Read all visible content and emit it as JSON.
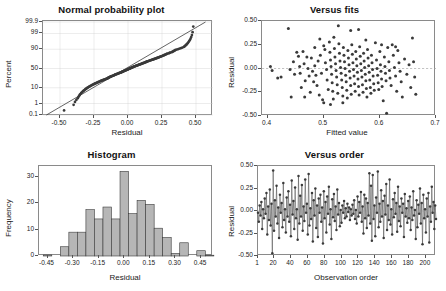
{
  "figure": {
    "panels": [
      "Normal probability plot",
      "Versus fits",
      "Histogram",
      "Versus order"
    ]
  },
  "chart_data": [
    {
      "type": "scatter",
      "title": "Normal probability plot",
      "xlabel": "Residual",
      "ylabel": "Percent",
      "xlim": [
        -0.625,
        0.625
      ],
      "xticks": [
        -0.5,
        -0.25,
        0.0,
        0.25,
        0.5
      ],
      "xticklabels": [
        "-0.50",
        "-0.25",
        "0.00",
        "0.25",
        "0.50"
      ],
      "yscale": "normal-probability",
      "yticks": [
        0.1,
        1,
        10,
        50,
        90,
        99,
        99.9
      ],
      "yticklabels": [
        "0.1",
        "1",
        "10",
        "50",
        "90",
        "99",
        "99.9"
      ],
      "grid": true,
      "reference_line": {
        "type": "fit-line",
        "x": [
          -0.6,
          0.57
        ],
        "y": [
          0.1,
          99.9
        ]
      },
      "x": [
        -0.47,
        -0.4,
        -0.39,
        -0.38,
        -0.37,
        -0.365,
        -0.36,
        -0.355,
        -0.35,
        -0.345,
        -0.34,
        -0.335,
        -0.33,
        -0.325,
        -0.32,
        -0.315,
        -0.31,
        -0.305,
        -0.3,
        -0.295,
        -0.29,
        -0.285,
        -0.28,
        -0.275,
        -0.27,
        -0.265,
        -0.26,
        -0.255,
        -0.25,
        -0.245,
        -0.24,
        -0.235,
        -0.23,
        -0.225,
        -0.22,
        -0.215,
        -0.21,
        -0.205,
        -0.2,
        -0.195,
        -0.19,
        -0.185,
        -0.18,
        -0.175,
        -0.17,
        -0.165,
        -0.16,
        -0.155,
        -0.15,
        -0.148,
        -0.145,
        -0.142,
        -0.14,
        -0.136,
        -0.132,
        -0.128,
        -0.124,
        -0.12,
        -0.116,
        -0.112,
        -0.108,
        -0.104,
        -0.1,
        -0.097,
        -0.094,
        -0.09,
        -0.086,
        -0.082,
        -0.078,
        -0.074,
        -0.07,
        -0.066,
        -0.062,
        -0.058,
        -0.054,
        -0.05,
        -0.047,
        -0.044,
        -0.04,
        -0.037,
        -0.034,
        -0.03,
        -0.027,
        -0.024,
        -0.02,
        -0.017,
        -0.014,
        -0.01,
        -0.007,
        -0.004,
        0.0,
        0.003,
        0.006,
        0.01,
        0.013,
        0.016,
        0.02,
        0.023,
        0.026,
        0.03,
        0.033,
        0.036,
        0.04,
        0.043,
        0.046,
        0.05,
        0.054,
        0.058,
        0.062,
        0.066,
        0.07,
        0.074,
        0.078,
        0.082,
        0.086,
        0.09,
        0.094,
        0.098,
        0.102,
        0.106,
        0.11,
        0.114,
        0.118,
        0.122,
        0.126,
        0.13,
        0.134,
        0.138,
        0.142,
        0.146,
        0.15,
        0.155,
        0.16,
        0.165,
        0.17,
        0.175,
        0.18,
        0.185,
        0.19,
        0.195,
        0.2,
        0.205,
        0.21,
        0.215,
        0.22,
        0.225,
        0.23,
        0.235,
        0.24,
        0.245,
        0.25,
        0.255,
        0.26,
        0.265,
        0.27,
        0.275,
        0.28,
        0.285,
        0.29,
        0.3,
        0.305,
        0.31,
        0.32,
        0.325,
        0.33,
        0.335,
        0.34,
        0.345,
        0.35,
        0.36,
        0.37,
        0.38,
        0.39,
        0.4,
        0.41,
        0.415,
        0.42,
        0.425,
        0.43,
        0.435,
        0.44,
        0.445,
        0.45,
        0.455,
        0.46,
        0.465,
        0.47,
        0.475,
        0.48
      ],
      "n": 189
    },
    {
      "type": "scatter",
      "title": "Versus fits",
      "xlabel": "Fitted value",
      "ylabel": "Residual",
      "xlim": [
        0.39,
        0.7
      ],
      "xticks": [
        0.4,
        0.5,
        0.6,
        0.7
      ],
      "xticklabels": [
        "0.4",
        "0.5",
        "0.6",
        "0.7"
      ],
      "ylim": [
        -0.5,
        0.5
      ],
      "yticks": [
        -0.5,
        -0.25,
        0.0,
        0.25,
        0.5
      ],
      "yticklabels": [
        "-0.50",
        "-0.25",
        "0.00",
        "0.25",
        "0.50"
      ],
      "grid": false,
      "reference_line": {
        "type": "hline",
        "y": 0.0
      },
      "points": [
        [
          0.405,
          0.02
        ],
        [
          0.408,
          -0.02
        ],
        [
          0.418,
          -0.1
        ],
        [
          0.424,
          -0.09
        ],
        [
          0.437,
          0.42
        ],
        [
          0.44,
          -0.01
        ],
        [
          0.442,
          -0.3
        ],
        [
          0.448,
          -0.06
        ],
        [
          0.452,
          0.17
        ],
        [
          0.455,
          0.13
        ],
        [
          0.457,
          0.02
        ],
        [
          0.458,
          -0.05
        ],
        [
          0.46,
          -0.2
        ],
        [
          0.463,
          0.18
        ],
        [
          0.465,
          0.05
        ],
        [
          0.467,
          -0.13
        ],
        [
          0.47,
          0.12
        ],
        [
          0.472,
          0.0
        ],
        [
          0.474,
          -0.08
        ],
        [
          0.476,
          -0.25
        ],
        [
          0.478,
          0.11
        ],
        [
          0.48,
          -0.03
        ],
        [
          0.482,
          -0.14
        ],
        [
          0.484,
          0.03
        ],
        [
          0.486,
          -0.07
        ],
        [
          0.488,
          -0.18
        ],
        [
          0.49,
          0.08
        ],
        [
          0.492,
          -0.28
        ],
        [
          0.494,
          0.14
        ],
        [
          0.496,
          -0.05
        ],
        [
          0.498,
          -0.33
        ],
        [
          0.5,
          0.24
        ],
        [
          0.502,
          0.2
        ],
        [
          0.503,
          0.06
        ],
        [
          0.505,
          -0.01
        ],
        [
          0.506,
          -0.12
        ],
        [
          0.508,
          -0.22
        ],
        [
          0.51,
          0.28
        ],
        [
          0.511,
          0.17
        ],
        [
          0.512,
          0.09
        ],
        [
          0.513,
          0.02
        ],
        [
          0.514,
          -0.06
        ],
        [
          0.515,
          -0.15
        ],
        [
          0.516,
          -0.24
        ],
        [
          0.517,
          -0.32
        ],
        [
          0.518,
          0.33
        ],
        [
          0.519,
          0.21
        ],
        [
          0.52,
          0.12
        ],
        [
          0.521,
          0.05
        ],
        [
          0.522,
          -0.02
        ],
        [
          0.523,
          -0.09
        ],
        [
          0.524,
          -0.17
        ],
        [
          0.525,
          -0.26
        ],
        [
          0.526,
          0.45
        ],
        [
          0.527,
          0.26
        ],
        [
          0.528,
          0.16
        ],
        [
          0.529,
          0.08
        ],
        [
          0.53,
          0.01
        ],
        [
          0.531,
          -0.05
        ],
        [
          0.532,
          -0.12
        ],
        [
          0.533,
          -0.2
        ],
        [
          0.534,
          -0.29
        ],
        [
          0.535,
          0.22
        ],
        [
          0.536,
          0.14
        ],
        [
          0.537,
          0.07
        ],
        [
          0.538,
          0.0
        ],
        [
          0.539,
          -0.07
        ],
        [
          0.54,
          -0.14
        ],
        [
          0.541,
          -0.23
        ],
        [
          0.542,
          -0.31
        ],
        [
          0.543,
          0.19
        ],
        [
          0.544,
          0.11
        ],
        [
          0.545,
          0.04
        ],
        [
          0.546,
          -0.03
        ],
        [
          0.547,
          -0.1
        ],
        [
          0.548,
          -0.18
        ],
        [
          0.549,
          -0.27
        ],
        [
          0.55,
          0.25
        ],
        [
          0.551,
          0.15
        ],
        [
          0.552,
          0.06
        ],
        [
          0.553,
          -0.01
        ],
        [
          0.554,
          -0.08
        ],
        [
          0.555,
          -0.16
        ],
        [
          0.556,
          -0.24
        ],
        [
          0.557,
          0.18
        ],
        [
          0.558,
          0.1
        ],
        [
          0.559,
          0.03
        ],
        [
          0.56,
          -0.04
        ],
        [
          0.561,
          -0.11
        ],
        [
          0.562,
          -0.19
        ],
        [
          0.563,
          -0.28
        ],
        [
          0.564,
          0.23
        ],
        [
          0.565,
          0.13
        ],
        [
          0.566,
          0.05
        ],
        [
          0.567,
          -0.02
        ],
        [
          0.568,
          -0.09
        ],
        [
          0.569,
          -0.17
        ],
        [
          0.57,
          -0.25
        ],
        [
          0.571,
          0.16
        ],
        [
          0.572,
          0.08
        ],
        [
          0.573,
          0.01
        ],
        [
          0.574,
          -0.06
        ],
        [
          0.575,
          -0.13
        ],
        [
          0.576,
          -0.21
        ],
        [
          0.577,
          -0.3
        ],
        [
          0.578,
          0.2
        ],
        [
          0.579,
          0.11
        ],
        [
          0.58,
          0.03
        ],
        [
          0.581,
          -0.04
        ],
        [
          0.582,
          -0.12
        ],
        [
          0.583,
          -0.2
        ],
        [
          0.584,
          -0.26
        ],
        [
          0.585,
          0.14
        ],
        [
          0.586,
          0.06
        ],
        [
          0.587,
          -0.01
        ],
        [
          0.588,
          -0.08
        ],
        [
          0.589,
          -0.16
        ],
        [
          0.59,
          -0.23
        ],
        [
          0.592,
          0.27
        ],
        [
          0.594,
          0.09
        ],
        [
          0.595,
          0.0
        ],
        [
          0.596,
          -0.07
        ],
        [
          0.597,
          -0.15
        ],
        [
          0.598,
          -0.22
        ],
        [
          0.6,
          0.18
        ],
        [
          0.601,
          0.04
        ],
        [
          0.602,
          -0.03
        ],
        [
          0.603,
          -0.11
        ],
        [
          0.604,
          -0.19
        ],
        [
          0.606,
          -0.34
        ],
        [
          0.608,
          0.12
        ],
        [
          0.609,
          0.02
        ],
        [
          0.61,
          -0.05
        ],
        [
          0.611,
          -0.13
        ],
        [
          0.612,
          -0.47
        ],
        [
          0.614,
          0.22
        ],
        [
          0.616,
          0.07
        ],
        [
          0.617,
          -0.02
        ],
        [
          0.618,
          -0.1
        ],
        [
          0.62,
          -0.18
        ],
        [
          0.622,
          0.25
        ],
        [
          0.624,
          0.14
        ],
        [
          0.626,
          0.01
        ],
        [
          0.628,
          -0.08
        ],
        [
          0.63,
          -0.24
        ],
        [
          0.632,
          0.19
        ],
        [
          0.634,
          0.06
        ],
        [
          0.636,
          -0.03
        ],
        [
          0.638,
          -0.14
        ],
        [
          0.64,
          -0.3
        ],
        [
          0.644,
          0.1
        ],
        [
          0.648,
          -0.06
        ],
        [
          0.652,
          0.04
        ],
        [
          0.655,
          -0.2
        ],
        [
          0.658,
          0.32
        ],
        [
          0.66,
          0.07
        ],
        [
          0.662,
          -0.09
        ],
        [
          0.664,
          -0.27
        ],
        [
          0.5,
          -0.36
        ],
        [
          0.512,
          -0.38
        ],
        [
          0.534,
          -0.36
        ],
        [
          0.548,
          0.4
        ],
        [
          0.562,
          0.41
        ],
        [
          0.484,
          0.22
        ],
        [
          0.466,
          -0.3
        ],
        [
          0.446,
          0.07
        ],
        [
          0.493,
          0.31
        ],
        [
          0.575,
          0.3
        ],
        [
          0.603,
          0.25
        ],
        [
          0.628,
          0.23
        ]
      ]
    },
    {
      "type": "bar",
      "title": "Histogram",
      "xlabel": "Residual",
      "ylabel": "Frequency",
      "xlim": [
        -0.5,
        0.52
      ],
      "xticks": [
        -0.45,
        -0.3,
        -0.15,
        0.0,
        0.15,
        0.3,
        0.45
      ],
      "xticklabels": [
        "-0.45",
        "-0.30",
        "-0.15",
        "0.00",
        "0.15",
        "0.30",
        "0.45"
      ],
      "ylim": [
        0,
        34
      ],
      "yticks": [
        0,
        10,
        20,
        30
      ],
      "yticklabels": [
        "0",
        "10",
        "20",
        "30"
      ],
      "bin_width": 0.05,
      "bin_starts": [
        -0.475,
        -0.425,
        -0.375,
        -0.325,
        -0.275,
        -0.225,
        -0.175,
        -0.125,
        -0.075,
        -0.025,
        0.025,
        0.075,
        0.125,
        0.175,
        0.225,
        0.275,
        0.325,
        0.375,
        0.425,
        0.475
      ],
      "values": [
        0.4,
        0,
        3.5,
        9,
        9,
        17.5,
        14,
        18.5,
        14,
        32,
        16,
        21,
        19.5,
        10.5,
        7,
        1,
        5,
        0,
        2,
        0.3
      ]
    },
    {
      "type": "line",
      "title": "Versus order",
      "xlabel": "Observation order",
      "ylabel": "Residual",
      "xlim": [
        1,
        212
      ],
      "xticks": [
        1,
        20,
        40,
        60,
        80,
        100,
        120,
        140,
        160,
        180,
        200
      ],
      "xticklabels": [
        "1",
        "20",
        "40",
        "60",
        "80",
        "100",
        "120",
        "140",
        "160",
        "180",
        "200"
      ],
      "ylim": [
        -0.5,
        0.5
      ],
      "yticks": [
        -0.5,
        -0.25,
        0.0,
        0.25,
        0.5
      ],
      "yticklabels": [
        "-0.50",
        "-0.25",
        "0.00",
        "0.25",
        "0.50"
      ],
      "reference_line": {
        "type": "hline",
        "y": 0.0
      },
      "markers": true,
      "values": [
        -0.02,
        -0.12,
        0.06,
        -0.05,
        0.1,
        -0.2,
        0.02,
        -0.08,
        0.14,
        -0.03,
        0.2,
        -0.26,
        0.05,
        -0.1,
        0.24,
        -0.16,
        0.08,
        -0.47,
        0.45,
        -0.22,
        0.12,
        -0.06,
        0.28,
        -0.14,
        0.04,
        -0.3,
        0.18,
        -0.02,
        0.09,
        -0.18,
        0.31,
        -0.1,
        0.02,
        -0.24,
        0.15,
        -0.06,
        0.22,
        -0.12,
        0.07,
        -0.28,
        0.34,
        -0.04,
        0.11,
        -0.2,
        0.26,
        -0.08,
        0.02,
        -0.32,
        0.39,
        -0.14,
        0.17,
        -0.06,
        0.29,
        -0.22,
        0.05,
        -0.11,
        0.35,
        -0.02,
        0.08,
        -0.26,
        0.41,
        -0.16,
        0.03,
        -0.09,
        0.2,
        -0.34,
        0.12,
        -0.05,
        0.25,
        -0.19,
        0.06,
        -0.29,
        0.14,
        -0.02,
        0.18,
        -0.12,
        0.04,
        -0.36,
        0.22,
        -0.08,
        0.1,
        -0.24,
        0.16,
        -0.03,
        0.27,
        -0.15,
        0.02,
        -0.31,
        0.13,
        -0.07,
        0.19,
        -0.11,
        0.05,
        -0.21,
        0.24,
        -0.04,
        0.09,
        -0.17,
        0.01,
        -0.13,
        0.06,
        -0.02,
        0.11,
        -0.08,
        0.03,
        -0.06,
        0.08,
        -0.01,
        0.04,
        -0.1,
        0.02,
        -0.05,
        0.07,
        -0.03,
        0.12,
        -0.09,
        0.01,
        -0.14,
        0.16,
        -0.06,
        0.1,
        -0.02,
        0.21,
        -0.12,
        0.05,
        -0.25,
        0.18,
        -0.08,
        0.14,
        -0.19,
        0.09,
        -0.05,
        0.42,
        -0.14,
        0.28,
        -0.33,
        0.4,
        -0.09,
        0.06,
        -0.28,
        0.15,
        -0.02,
        0.44,
        -0.18,
        0.08,
        -0.12,
        0.23,
        -0.06,
        0.11,
        -0.3,
        0.17,
        -0.04,
        0.3,
        -0.21,
        0.06,
        -0.1,
        0.35,
        -0.15,
        0.02,
        -0.26,
        0.13,
        -0.07,
        0.2,
        -0.03,
        0.09,
        -0.23,
        0.27,
        -0.11,
        0.05,
        -0.17,
        0.14,
        -0.02,
        0.08,
        -0.29,
        0.19,
        -0.06,
        0.03,
        -0.13,
        0.11,
        -0.08,
        0.16,
        -0.21,
        0.04,
        -0.1,
        0.22,
        -0.05,
        0.01,
        -0.31,
        0.12,
        -0.18,
        0.07,
        -0.03,
        0.25,
        -0.14,
        0.09,
        -0.37,
        0.18,
        -0.08,
        0.02,
        -0.24,
        0.14,
        -0.06,
        0.2,
        -0.35,
        0.05,
        -0.12,
        0.27,
        -0.02,
        0.1,
        -0.2,
        0.06,
        -0.09
      ]
    }
  ]
}
